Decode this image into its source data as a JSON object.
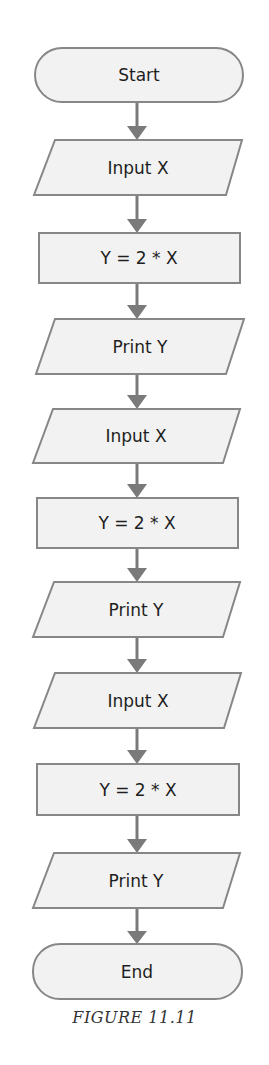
{
  "diagram": {
    "type": "flowchart",
    "nodes": [
      {
        "id": "n0",
        "shape": "terminator",
        "label": "Start"
      },
      {
        "id": "n1",
        "shape": "io",
        "label": "Input X"
      },
      {
        "id": "n2",
        "shape": "process",
        "label": "Y = 2 * X"
      },
      {
        "id": "n3",
        "shape": "io",
        "label": "Print Y"
      },
      {
        "id": "n4",
        "shape": "io",
        "label": "Input X"
      },
      {
        "id": "n5",
        "shape": "process",
        "label": "Y = 2 * X"
      },
      {
        "id": "n6",
        "shape": "io",
        "label": "Print Y"
      },
      {
        "id": "n7",
        "shape": "io",
        "label": "Input X"
      },
      {
        "id": "n8",
        "shape": "process",
        "label": "Y = 2 * X"
      },
      {
        "id": "n9",
        "shape": "io",
        "label": "Print Y"
      },
      {
        "id": "n10",
        "shape": "terminator",
        "label": "End"
      }
    ],
    "edges": [
      [
        "n0",
        "n1"
      ],
      [
        "n1",
        "n2"
      ],
      [
        "n2",
        "n3"
      ],
      [
        "n3",
        "n4"
      ],
      [
        "n4",
        "n5"
      ],
      [
        "n5",
        "n6"
      ],
      [
        "n6",
        "n7"
      ],
      [
        "n7",
        "n8"
      ],
      [
        "n8",
        "n9"
      ],
      [
        "n9",
        "n10"
      ]
    ],
    "colors": {
      "fill": "#f2f2f2",
      "stroke": "#878787",
      "arrow": "#7a7a7a",
      "text": "#1e1e1e"
    }
  },
  "caption": "FIGURE 11.11"
}
